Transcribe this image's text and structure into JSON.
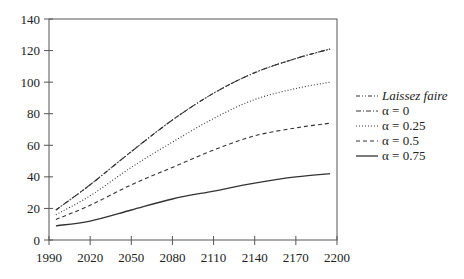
{
  "chart_data": {
    "type": "line",
    "title": "",
    "xlabel": "",
    "ylabel": "",
    "xlim": [
      1990,
      2200
    ],
    "ylim": [
      0,
      140
    ],
    "x_ticks": [
      1990,
      2020,
      2050,
      2080,
      2110,
      2140,
      2170,
      2200
    ],
    "y_ticks": [
      0,
      20,
      40,
      60,
      80,
      100,
      120,
      140
    ],
    "grid": false,
    "legend_position": "right",
    "x": [
      1995,
      2020,
      2050,
      2080,
      2110,
      2140,
      2170,
      2195
    ],
    "series": [
      {
        "name": "Laissez faire",
        "style": "dash-dot-dot",
        "values": [
          19,
          35,
          56,
          76,
          93,
          106,
          115,
          121
        ]
      },
      {
        "name": "α = 0",
        "style": "dash-dot",
        "values": [
          19,
          35,
          56,
          76,
          93,
          106,
          115,
          121
        ]
      },
      {
        "name": "α = 0.25",
        "style": "dotted",
        "values": [
          16,
          28,
          46,
          62,
          77,
          89,
          96,
          100
        ]
      },
      {
        "name": "α = 0.5",
        "style": "dashed",
        "values": [
          13,
          22,
          35,
          46,
          57,
          66,
          71,
          74
        ]
      },
      {
        "name": "α = 0.75",
        "style": "solid",
        "values": [
          9,
          12,
          19,
          26,
          31,
          36,
          40,
          42
        ]
      }
    ]
  },
  "legend": {
    "items": [
      {
        "label": "Laissez faire"
      },
      {
        "label": "α = 0"
      },
      {
        "label": "α = 0.25"
      },
      {
        "label": "α = 0.5"
      },
      {
        "label": "α = 0.75"
      }
    ]
  }
}
